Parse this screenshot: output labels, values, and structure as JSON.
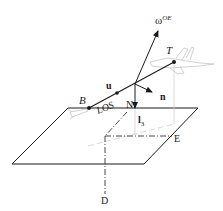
{
  "diagram": {
    "labels": {
      "omega": "ω",
      "omega_sup": "OE",
      "target": "T",
      "body": "B",
      "u": "u",
      "n": "n",
      "l3": "l",
      "l3_sub": "3",
      "los": "LOS",
      "north": "N",
      "east": "E",
      "down": "D"
    },
    "colors": {
      "line": "#1a1a1a",
      "projection": "#c8c8c8",
      "aircraft": "#bdbdbd"
    }
  }
}
